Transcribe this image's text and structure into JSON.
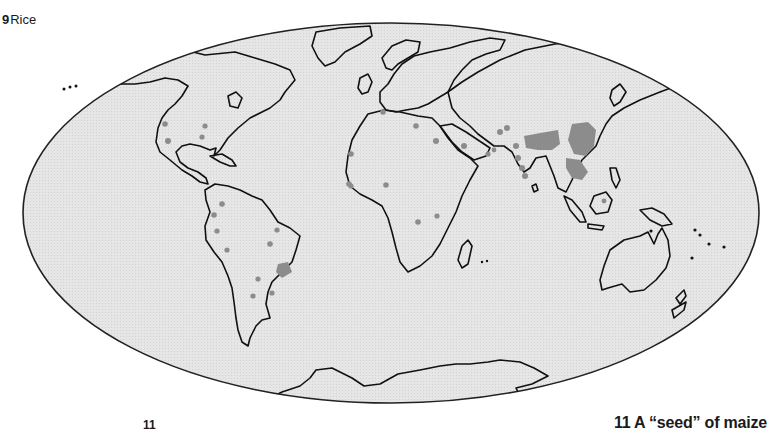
{
  "figure": {
    "number": "9",
    "title": "Rice"
  },
  "map": {
    "projection": "Mollweide (world, oval)",
    "ocean_fill": "#e4e4e4",
    "land_outline": "#111111",
    "rice_region_color": "#8c8c8c",
    "legend": "Shaded areas: rice-growing regions"
  },
  "footer": {
    "page_number": "11",
    "next_caption": "11 A “seed” of maize"
  }
}
